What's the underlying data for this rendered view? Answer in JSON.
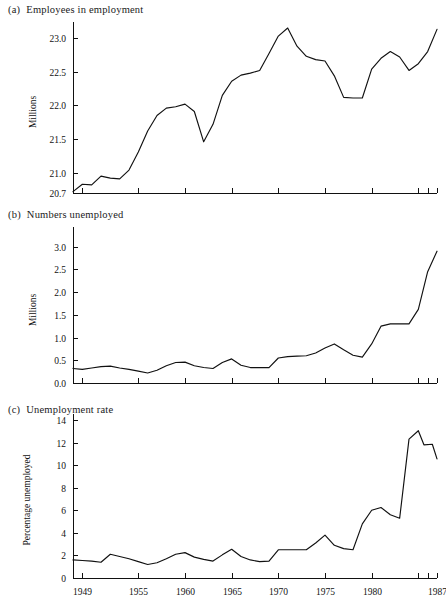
{
  "figure": {
    "background": "#ffffff",
    "line_color": "#111111",
    "axis_color": "#111111"
  },
  "panels": [
    {
      "tag": "(a)",
      "title": "Employees in employment"
    },
    {
      "tag": "(b)",
      "title": "Numbers unemployed"
    },
    {
      "tag": "(c)",
      "title": "Unemployment rate"
    }
  ],
  "chart_data": [
    {
      "type": "line",
      "panel": "(a)",
      "title": "Employees in employment",
      "xlabel": "",
      "ylabel": "Millions",
      "xlim": [
        1948,
        1987
      ],
      "ylim": [
        20.7,
        23.15
      ],
      "grid": false,
      "legend": "none",
      "ytick_labels": [
        "20.7",
        "21.0",
        "21.5",
        "22.0",
        "22.5",
        "23.0"
      ],
      "ytick_values": [
        20.7,
        21.0,
        21.5,
        22.0,
        22.5,
        23.0
      ],
      "xtick_labels": [
        "1949",
        "1955",
        "1960",
        "1965",
        "1970",
        "1975",
        "1980",
        "1985",
        "1986",
        "1987"
      ],
      "xtick_values": [
        1949,
        1955,
        1960,
        1965,
        1970,
        1975,
        1980,
        1985,
        1986,
        1987
      ],
      "x": [
        1948,
        1949,
        1950,
        1951,
        1952,
        1953,
        1954,
        1955,
        1956,
        1957,
        1958,
        1959,
        1960,
        1961,
        1962,
        1963,
        1964,
        1965,
        1966,
        1967,
        1968,
        1969,
        1970,
        1971,
        1972,
        1973,
        1974,
        1975,
        1976,
        1977,
        1978,
        1979,
        1980,
        1981,
        1982,
        1983,
        1984,
        1985,
        1986,
        1987
      ],
      "values": [
        20.72,
        20.83,
        20.82,
        20.95,
        20.92,
        20.91,
        21.04,
        21.31,
        21.62,
        21.85,
        21.96,
        21.98,
        22.02,
        21.91,
        21.46,
        21.72,
        22.15,
        22.36,
        22.45,
        22.48,
        22.52,
        22.77,
        23.03,
        23.15,
        22.88,
        22.73,
        22.68,
        22.66,
        22.44,
        22.12,
        22.11,
        22.11,
        22.54,
        22.7,
        22.8,
        22.72,
        22.52,
        22.62,
        22.8,
        23.13
      ]
    },
    {
      "type": "line",
      "panel": "(b)",
      "title": "Numbers unemployed",
      "xlabel": "",
      "ylabel": "Millions",
      "xlim": [
        1948,
        1987
      ],
      "ylim": [
        0.0,
        3.3
      ],
      "grid": false,
      "legend": "none",
      "ytick_labels": [
        "0.0",
        "0.5",
        "1.0",
        "1.5",
        "2.0",
        "2.5",
        "3.0"
      ],
      "ytick_values": [
        0.0,
        0.5,
        1.0,
        1.5,
        2.0,
        2.5,
        3.0
      ],
      "xtick_labels": [
        "1949",
        "1955",
        "1960",
        "1965",
        "1970",
        "1975",
        "1980",
        "1985",
        "1986",
        "1987"
      ],
      "xtick_values": [
        1949,
        1955,
        1960,
        1965,
        1970,
        1975,
        1980,
        1985,
        1986,
        1987
      ],
      "x": [
        1948,
        1949,
        1950,
        1951,
        1952,
        1953,
        1954,
        1955,
        1956,
        1957,
        1958,
        1959,
        1960,
        1961,
        1962,
        1963,
        1964,
        1965,
        1966,
        1967,
        1968,
        1969,
        1970,
        1971,
        1972,
        1973,
        1974,
        1975,
        1976,
        1977,
        1978,
        1979,
        1980,
        1981,
        1982,
        1983,
        1984,
        1985,
        1986,
        1987
      ],
      "values": [
        0.32,
        0.3,
        0.33,
        0.36,
        0.37,
        0.33,
        0.3,
        0.26,
        0.22,
        0.28,
        0.38,
        0.45,
        0.46,
        0.38,
        0.34,
        0.32,
        0.45,
        0.53,
        0.39,
        0.34,
        0.34,
        0.34,
        0.55,
        0.58,
        0.59,
        0.6,
        0.66,
        0.77,
        0.86,
        0.73,
        0.61,
        0.57,
        0.86,
        1.25,
        1.3,
        1.3,
        1.3,
        1.62,
        2.45,
        2.9
      ]
    },
    {
      "type": "line",
      "panel": "(c)",
      "title": "Unemployment rate",
      "xlabel": "",
      "ylabel": "Percentage unemployed",
      "xlim": [
        1948,
        1987
      ],
      "ylim": [
        0,
        14
      ],
      "grid": false,
      "legend": "none",
      "ytick_labels": [
        "0",
        "2",
        "4",
        "6",
        "8",
        "10",
        "12",
        "14"
      ],
      "ytick_values": [
        0,
        2,
        4,
        6,
        8,
        10,
        12,
        14
      ],
      "xtick_labels": [
        "1949",
        "1955",
        "1960",
        "1965",
        "1970",
        "1975",
        "1980",
        "1985",
        "1986",
        "1987"
      ],
      "xtick_values": [
        1949,
        1955,
        1960,
        1965,
        1970,
        1975,
        1980,
        1985,
        1986,
        1987
      ],
      "x": [
        1948,
        1949,
        1950,
        1951,
        1952,
        1953,
        1954,
        1955,
        1956,
        1957,
        1958,
        1959,
        1960,
        1961,
        1962,
        1963,
        1964,
        1965,
        1966,
        1967,
        1968,
        1969,
        1970,
        1971,
        1972,
        1973,
        1974,
        1975,
        1976,
        1977,
        1978,
        1979,
        1980,
        1981,
        1982,
        1983,
        1984,
        1985,
        1986,
        1987
      ],
      "values": [
        1.6,
        1.55,
        1.5,
        1.4,
        2.1,
        1.9,
        1.7,
        1.45,
        1.2,
        1.35,
        1.7,
        2.1,
        2.25,
        1.85,
        1.65,
        1.5,
        2.05,
        2.55,
        1.9,
        1.6,
        1.45,
        1.5,
        2.5,
        2.5,
        2.5,
        2.5,
        3.1,
        3.8,
        2.9,
        2.6,
        2.5,
        4.8,
        6.0,
        6.25,
        5.6,
        5.3,
        8.0,
        10.6,
        12.3,
        13.05
      ]
    }
  ],
  "extra_series_c_tail": {
    "note": "tail segment after peak",
    "x": [
      1984,
      1985,
      1986,
      1987
    ],
    "values": [
      11.8,
      11.85,
      11.85,
      10.55
    ]
  }
}
